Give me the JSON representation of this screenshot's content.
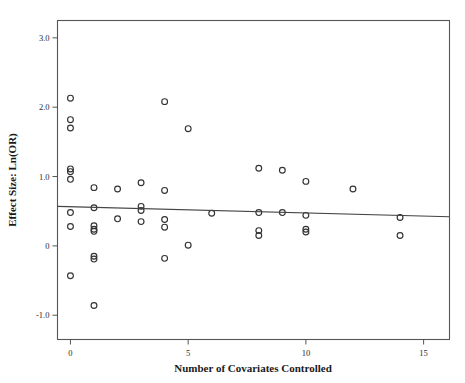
{
  "chart_data": {
    "type": "scatter",
    "title": "",
    "xlabel": "Number of Covariates Controlled",
    "ylabel": "Effect Size: Ln(OR)",
    "xlim": [
      -0.55,
      16.1
    ],
    "ylim": [
      -1.35,
      3.25
    ],
    "xticks": [
      0,
      5,
      10,
      15
    ],
    "xtick_labels": [
      "0",
      "5",
      "10",
      "15"
    ],
    "yticks": [
      3.0,
      2.0,
      1.0,
      0.0,
      -1.0
    ],
    "ytick_labels": [
      "3.0",
      "2.0",
      "1.0",
      "0",
      "-1.0"
    ],
    "grid": false,
    "legend": "none",
    "marker": "open-circle",
    "points": [
      {
        "x": 0,
        "y": 2.13
      },
      {
        "x": 0,
        "y": 1.82
      },
      {
        "x": 0,
        "y": 1.7
      },
      {
        "x": 0,
        "y": 1.11
      },
      {
        "x": 0,
        "y": 1.07
      },
      {
        "x": 0,
        "y": 0.96
      },
      {
        "x": 0,
        "y": 0.48
      },
      {
        "x": 0,
        "y": 0.28
      },
      {
        "x": 0,
        "y": -0.43
      },
      {
        "x": 1,
        "y": 0.84
      },
      {
        "x": 1,
        "y": 0.55
      },
      {
        "x": 1,
        "y": 0.29
      },
      {
        "x": 1,
        "y": 0.24
      },
      {
        "x": 1,
        "y": 0.21
      },
      {
        "x": 1,
        "y": -0.15
      },
      {
        "x": 1,
        "y": -0.19
      },
      {
        "x": 1,
        "y": -0.86
      },
      {
        "x": 2,
        "y": 0.82
      },
      {
        "x": 2,
        "y": 0.39
      },
      {
        "x": 3,
        "y": 0.91
      },
      {
        "x": 3,
        "y": 0.57
      },
      {
        "x": 3,
        "y": 0.51
      },
      {
        "x": 3,
        "y": 0.35
      },
      {
        "x": 4,
        "y": 2.08
      },
      {
        "x": 4,
        "y": 0.8
      },
      {
        "x": 4,
        "y": 0.38
      },
      {
        "x": 4,
        "y": 0.27
      },
      {
        "x": 4,
        "y": -0.18
      },
      {
        "x": 5,
        "y": 1.69
      },
      {
        "x": 5,
        "y": 0.01
      },
      {
        "x": 6,
        "y": 0.47
      },
      {
        "x": 8,
        "y": 1.12
      },
      {
        "x": 8,
        "y": 0.48
      },
      {
        "x": 8,
        "y": 0.22
      },
      {
        "x": 8,
        "y": 0.15
      },
      {
        "x": 9,
        "y": 1.09
      },
      {
        "x": 9,
        "y": 0.48
      },
      {
        "x": 10,
        "y": 0.93
      },
      {
        "x": 10,
        "y": 0.44
      },
      {
        "x": 10,
        "y": 0.24
      },
      {
        "x": 10,
        "y": 0.2
      },
      {
        "x": 12,
        "y": 0.82
      },
      {
        "x": 14,
        "y": 0.41
      },
      {
        "x": 14,
        "y": 0.15
      }
    ],
    "fit_line": {
      "type": "linear-regression",
      "x_start": -0.55,
      "y_start": 0.57,
      "x_end": 16.1,
      "y_end": 0.42
    },
    "colors": {
      "marker_stroke": "#333333",
      "fit_line": "#444444",
      "frame": "#555555",
      "text": "#1a1a1a",
      "background": "#ffffff"
    }
  }
}
